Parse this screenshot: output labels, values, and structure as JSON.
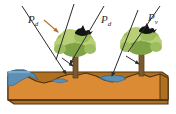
{
  "figure": {
    "width": 176,
    "height": 114,
    "background": "#ffffff"
  },
  "labels": [
    {
      "id": "pd1",
      "symbol": "P",
      "subscript": "d",
      "text": "Pd",
      "meaning": "direct-throughfall-flux",
      "x": 28,
      "y": 14
    },
    {
      "id": "pd2",
      "symbol": "P",
      "subscript": "d",
      "text": "Pd",
      "meaning": "direct-throughfall-flux",
      "x": 101,
      "y": 14
    },
    {
      "id": "pv",
      "symbol": "P",
      "subscript": "v",
      "text": "Pv",
      "meaning": "canopy-intercepted-flux",
      "x": 148,
      "y": 12
    }
  ],
  "colors": {
    "soil": "#db8b33",
    "soil_top": "#d88a30",
    "soil_side": "#b0701f",
    "soil_outline": "#4a3213",
    "water": "#5d8fb5",
    "water_dark": "#3f6f96",
    "foliage_light": "#b9cf76",
    "foliage_mid": "#9dbd5e",
    "foliage_dark": "#7fa246",
    "trunk": "#7a5a2e",
    "trunk_dark": "#5a4120",
    "bird": "#141414",
    "arrow": "#2b2b2b",
    "arrow_small": "#b5702c",
    "label_text": "#2b2b2b"
  },
  "elements": {
    "soil_block_name": "soil-block",
    "water_left_name": "water-pool-left",
    "water_right_name": "water-pool-right",
    "tree_left_name": "tree-left",
    "tree_right_name": "tree-right",
    "bird_left_name": "bird-left",
    "bird_right_name": "bird-right"
  },
  "arrows": {
    "rain_count": 5,
    "stemflow_count": 2,
    "small_count": 1,
    "description": "diagonal precipitation vectors directed down-right and down-left onto canopy, ground and water surfaces"
  }
}
